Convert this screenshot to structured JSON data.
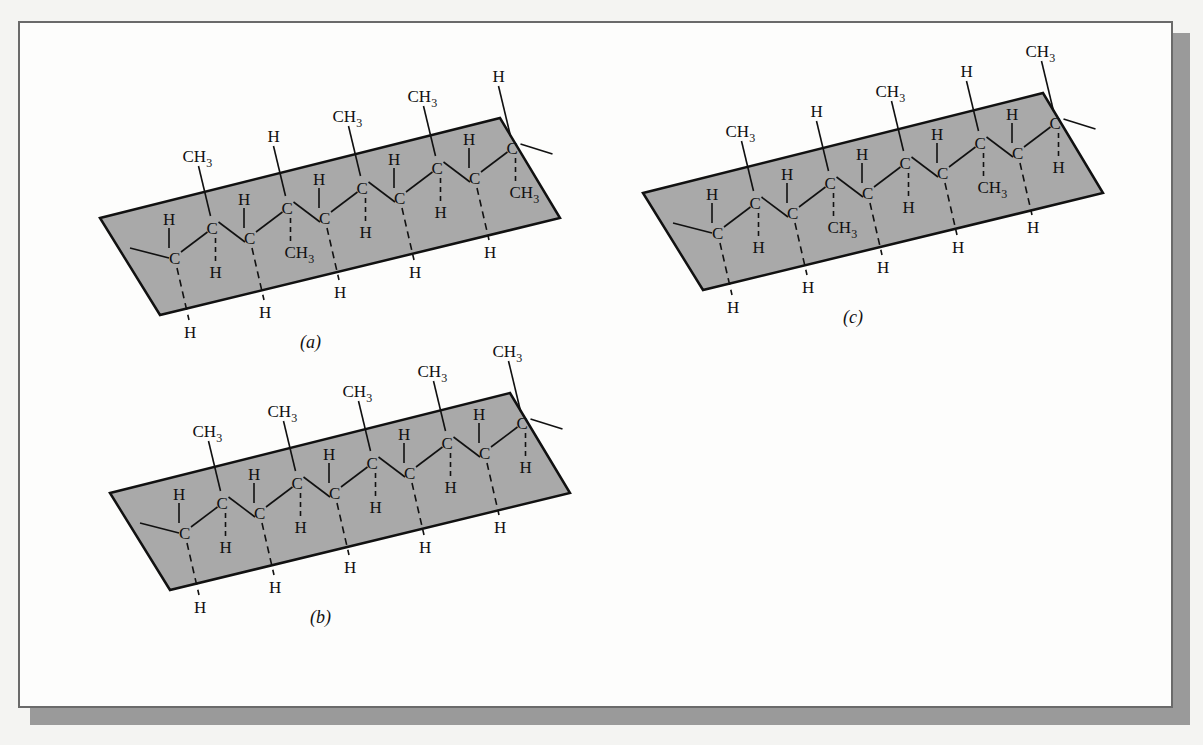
{
  "figure": {
    "type": "polymer stereochemistry diagram",
    "plane_color": "#a9a9a9",
    "frame_shadow_color": "#9a9a9a",
    "panels": [
      {
        "id": "a",
        "caption": "(a)",
        "tacticity": "syndiotactic",
        "methyl_positions": [
          "up",
          "down",
          "up",
          "up",
          "down"
        ],
        "atoms": {
          "carbon": "C",
          "hydrogen": "H",
          "methyl": "CH",
          "methyl_sub": "3"
        }
      },
      {
        "id": "b",
        "caption": "(b)",
        "tacticity": "isotactic",
        "methyl_positions": [
          "up",
          "up",
          "up",
          "up",
          "up"
        ],
        "atoms": {
          "carbon": "C",
          "hydrogen": "H",
          "methyl": "CH",
          "methyl_sub": "3"
        }
      },
      {
        "id": "c",
        "caption": "(c)",
        "tacticity": "atactic",
        "methyl_positions": [
          "up",
          "down",
          "up",
          "down",
          "up"
        ],
        "atoms": {
          "carbon": "C",
          "hydrogen": "H",
          "methyl": "CH",
          "methyl_sub": "3"
        }
      }
    ]
  }
}
